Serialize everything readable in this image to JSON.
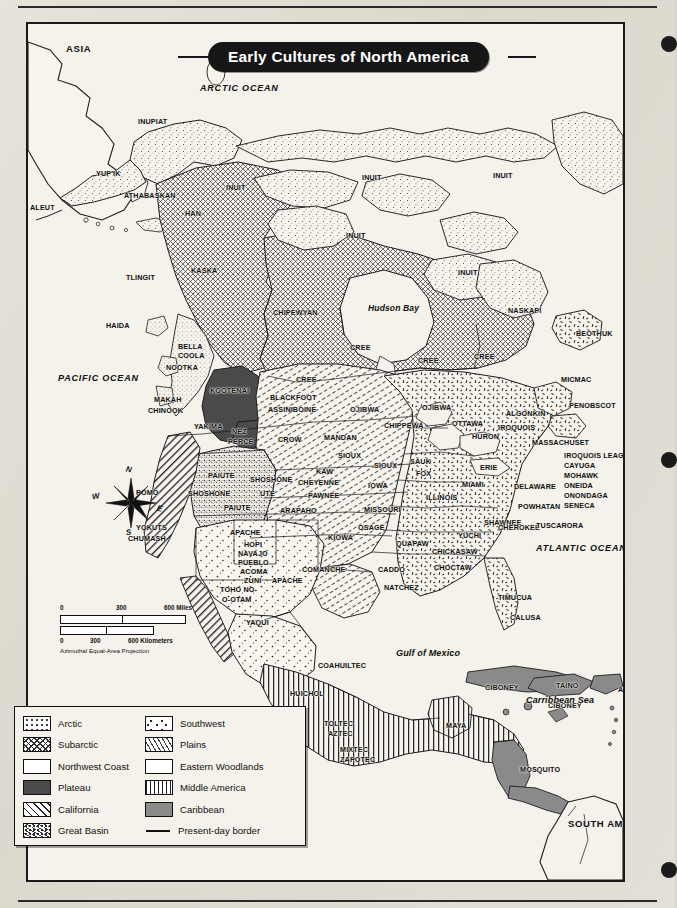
{
  "map": {
    "title": "Early Cultures of North America",
    "projection_note": "Azimuthal Equal-Area Projection",
    "scale": {
      "miles": {
        "zero": "0",
        "mid": "300",
        "max": "600 Miles"
      },
      "km": {
        "zero": "0",
        "mid": "300",
        "max": "600 Kilometers"
      }
    },
    "compass": {
      "n": "N",
      "s": "S",
      "e": "E",
      "w": "W"
    },
    "oceans": [
      {
        "name": "ARCTIC OCEAN",
        "x": 172,
        "y": 60
      },
      {
        "name": "PACIFIC OCEAN",
        "x": 30,
        "y": 350
      },
      {
        "name": "ATLANTIC OCEAN",
        "x": 508,
        "y": 520
      }
    ],
    "water_features": [
      {
        "name": "Hudson Bay",
        "x": 340,
        "y": 280
      },
      {
        "name": "Gulf of Mexico",
        "x": 368,
        "y": 625
      },
      {
        "name": "Carribbean Sea",
        "x": 498,
        "y": 672
      }
    ],
    "continents": [
      {
        "name": "ASIA",
        "x": 38,
        "y": 20
      },
      {
        "name": "SOUTH AMERICA",
        "x": 540,
        "y": 795
      }
    ],
    "culture_labels": [
      {
        "name": "INUPIAT",
        "x": 110,
        "y": 94
      },
      {
        "name": "YUP'IK",
        "x": 68,
        "y": 146
      },
      {
        "name": "ATHABASKAN",
        "x": 96,
        "y": 168
      },
      {
        "name": "ALEUT",
        "x": 2,
        "y": 180
      },
      {
        "name": "HAN",
        "x": 157,
        "y": 186
      },
      {
        "name": "INUIT",
        "x": 198,
        "y": 160
      },
      {
        "name": "INUIT",
        "x": 334,
        "y": 150
      },
      {
        "name": "INUIT",
        "x": 465,
        "y": 148
      },
      {
        "name": "INUIT",
        "x": 318,
        "y": 208
      },
      {
        "name": "INUIT",
        "x": 430,
        "y": 245
      },
      {
        "name": "KASKA",
        "x": 163,
        "y": 243
      },
      {
        "name": "TLINGIT",
        "x": 98,
        "y": 250
      },
      {
        "name": "HAIDA",
        "x": 78,
        "y": 298
      },
      {
        "name": "CHIPEWYAN",
        "x": 245,
        "y": 285
      },
      {
        "name": "NASKAPI",
        "x": 480,
        "y": 283
      },
      {
        "name": "BEOTHUK",
        "x": 548,
        "y": 306
      },
      {
        "name": "CREE",
        "x": 322,
        "y": 320
      },
      {
        "name": "CREE",
        "x": 390,
        "y": 333
      },
      {
        "name": "CREE",
        "x": 446,
        "y": 329
      },
      {
        "name": "CREE",
        "x": 268,
        "y": 352
      },
      {
        "name": "BELLA",
        "x": 150,
        "y": 319
      },
      {
        "name": "COOLA",
        "x": 150,
        "y": 328
      },
      {
        "name": "NOOTKA",
        "x": 138,
        "y": 340
      },
      {
        "name": "MAKAH",
        "x": 126,
        "y": 372
      },
      {
        "name": "CHINOOK",
        "x": 120,
        "y": 383
      },
      {
        "name": "KOOTENAI",
        "x": 182,
        "y": 363
      },
      {
        "name": "BLACKFOOT",
        "x": 242,
        "y": 370
      },
      {
        "name": "ASSINIBOINE",
        "x": 240,
        "y": 382
      },
      {
        "name": "OJIBWA",
        "x": 322,
        "y": 382
      },
      {
        "name": "OJIBWA",
        "x": 394,
        "y": 380
      },
      {
        "name": "MICMAC",
        "x": 533,
        "y": 352
      },
      {
        "name": "PENOBSCOT",
        "x": 541,
        "y": 378
      },
      {
        "name": "ALGONKIN",
        "x": 478,
        "y": 386
      },
      {
        "name": "YAKIMA",
        "x": 166,
        "y": 399
      },
      {
        "name": "NEZ",
        "x": 204,
        "y": 404
      },
      {
        "name": "PERCE",
        "x": 200,
        "y": 414
      },
      {
        "name": "CROW",
        "x": 250,
        "y": 412
      },
      {
        "name": "MANDAN",
        "x": 296,
        "y": 410
      },
      {
        "name": "CHIPPEWA",
        "x": 356,
        "y": 398
      },
      {
        "name": "OTTAWA",
        "x": 424,
        "y": 396
      },
      {
        "name": "HURON",
        "x": 444,
        "y": 409
      },
      {
        "name": "IROQUOIS",
        "x": 470,
        "y": 400
      },
      {
        "name": "MASSACHUSET",
        "x": 504,
        "y": 415
      },
      {
        "name": "IROQUOIS LEAGUE",
        "x": 536,
        "y": 428
      },
      {
        "name": "CAYUGA",
        "x": 536,
        "y": 438
      },
      {
        "name": "MOHAWK",
        "x": 536,
        "y": 448
      },
      {
        "name": "ONEIDA",
        "x": 536,
        "y": 458
      },
      {
        "name": "ONONDAGA",
        "x": 536,
        "y": 468
      },
      {
        "name": "SENECA",
        "x": 536,
        "y": 478
      },
      {
        "name": "SIOUX",
        "x": 310,
        "y": 428
      },
      {
        "name": "SIOUX",
        "x": 346,
        "y": 438
      },
      {
        "name": "SAUK",
        "x": 382,
        "y": 434
      },
      {
        "name": "FOX",
        "x": 388,
        "y": 446
      },
      {
        "name": "ERIE",
        "x": 452,
        "y": 440
      },
      {
        "name": "DELAWARE",
        "x": 486,
        "y": 459
      },
      {
        "name": "KAW",
        "x": 288,
        "y": 444
      },
      {
        "name": "CHEYENNE",
        "x": 270,
        "y": 455
      },
      {
        "name": "PAWNEE",
        "x": 280,
        "y": 468
      },
      {
        "name": "IOWA",
        "x": 340,
        "y": 458
      },
      {
        "name": "MIAMI",
        "x": 434,
        "y": 457
      },
      {
        "name": "ILLINOIS",
        "x": 398,
        "y": 470
      },
      {
        "name": "POWHATAN",
        "x": 490,
        "y": 479
      },
      {
        "name": "SHOSHONE",
        "x": 222,
        "y": 452
      },
      {
        "name": "PAIUTE",
        "x": 180,
        "y": 448
      },
      {
        "name": "UTE",
        "x": 232,
        "y": 466
      },
      {
        "name": "SHOSHONE",
        "x": 160,
        "y": 466
      },
      {
        "name": "ARAPAHO",
        "x": 252,
        "y": 483
      },
      {
        "name": "MISSOURI",
        "x": 336,
        "y": 482
      },
      {
        "name": "PAIUTE",
        "x": 196,
        "y": 480
      },
      {
        "name": "POMO",
        "x": 108,
        "y": 465
      },
      {
        "name": "YOKUTS",
        "x": 108,
        "y": 500
      },
      {
        "name": "CHUMASH",
        "x": 100,
        "y": 511
      },
      {
        "name": "SHAWNEE",
        "x": 456,
        "y": 495
      },
      {
        "name": "CHEROKEE",
        "x": 470,
        "y": 500
      },
      {
        "name": "OSAGE",
        "x": 330,
        "y": 500
      },
      {
        "name": "APACHE",
        "x": 202,
        "y": 505
      },
      {
        "name": "TUSCARORA",
        "x": 508,
        "y": 498
      },
      {
        "name": "HOPI",
        "x": 216,
        "y": 517
      },
      {
        "name": "NAVAJO",
        "x": 210,
        "y": 526
      },
      {
        "name": "PUEBLO",
        "x": 210,
        "y": 535
      },
      {
        "name": "ACOMA",
        "x": 212,
        "y": 544
      },
      {
        "name": "ZUNI",
        "x": 216,
        "y": 553
      },
      {
        "name": "APACHE",
        "x": 244,
        "y": 553
      },
      {
        "name": "KIOWA",
        "x": 300,
        "y": 510
      },
      {
        "name": "YUCHI",
        "x": 430,
        "y": 508
      },
      {
        "name": "QUAPAW",
        "x": 368,
        "y": 516
      },
      {
        "name": "CHICKASAW",
        "x": 404,
        "y": 524
      },
      {
        "name": "TOHO NO-",
        "x": 192,
        "y": 562
      },
      {
        "name": "O-OTAM",
        "x": 194,
        "y": 572
      },
      {
        "name": "COMANCHE",
        "x": 274,
        "y": 542
      },
      {
        "name": "CADDO",
        "x": 350,
        "y": 542
      },
      {
        "name": "CHOCTAW",
        "x": 406,
        "y": 540
      },
      {
        "name": "NATCHEZ",
        "x": 356,
        "y": 560
      },
      {
        "name": "TIMUCUA",
        "x": 470,
        "y": 570
      },
      {
        "name": "CALUSA",
        "x": 482,
        "y": 590
      },
      {
        "name": "YAQUI",
        "x": 218,
        "y": 595
      },
      {
        "name": "COAHUILTEC",
        "x": 290,
        "y": 638
      },
      {
        "name": "HUICHOL",
        "x": 262,
        "y": 666
      },
      {
        "name": "TOLTEC",
        "x": 296,
        "y": 696
      },
      {
        "name": "AZTEC",
        "x": 300,
        "y": 706
      },
      {
        "name": "MIXTEC",
        "x": 312,
        "y": 722
      },
      {
        "name": "ZAPOTEC",
        "x": 312,
        "y": 732
      },
      {
        "name": "MAYA",
        "x": 418,
        "y": 698
      },
      {
        "name": "CIBONEY",
        "x": 457,
        "y": 660
      },
      {
        "name": "TAINO",
        "x": 528,
        "y": 658
      },
      {
        "name": "ARAWAK",
        "x": 590,
        "y": 662
      },
      {
        "name": "CIBONEY",
        "x": 520,
        "y": 678
      },
      {
        "name": "MOSQUITO",
        "x": 492,
        "y": 742
      }
    ],
    "legend": {
      "left": [
        {
          "label": "Arctic",
          "swatch": "p-arctic"
        },
        {
          "label": "Subarctic",
          "swatch": "p-subarctic"
        },
        {
          "label": "Northwest Coast",
          "swatch": "p-nwcoast"
        },
        {
          "label": "Plateau",
          "swatch": "p-plateau"
        },
        {
          "label": "California",
          "swatch": "p-california"
        },
        {
          "label": "Great Basin",
          "swatch": "p-greatbasin"
        }
      ],
      "right": [
        {
          "label": "Southwest",
          "swatch": "p-southwest"
        },
        {
          "label": "Plains",
          "swatch": "p-plains"
        },
        {
          "label": "Eastern Woodlands",
          "swatch": "p-eastwood"
        },
        {
          "label": "Middle America",
          "swatch": "p-middle"
        },
        {
          "label": "Caribbean",
          "swatch": "p-caribbean"
        },
        {
          "label": "Present-day border",
          "swatch": "line"
        }
      ]
    },
    "colors": {
      "ink": "#111111",
      "paper": "#f2f0e8",
      "plateau": "#4a4a4a",
      "caribbean": "#8a8a8a",
      "title_bg": "#161616"
    }
  }
}
